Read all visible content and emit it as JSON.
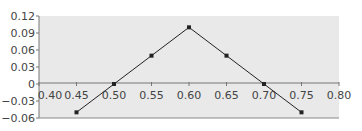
{
  "chart_data": {
    "type": "line",
    "title": "",
    "xlabel": "",
    "ylabel": "",
    "x": [
      0.45,
      0.5,
      0.55,
      0.6,
      0.65,
      0.7,
      0.75
    ],
    "series": [
      {
        "name": "series-1",
        "values": [
          -0.05,
          0.0,
          0.05,
          0.1,
          0.05,
          0.0,
          -0.05
        ],
        "color": "#222222"
      }
    ],
    "xlim": [
      0.4,
      0.8
    ],
    "ylim": [
      -0.06,
      0.12
    ],
    "x_ticks": [
      "0.40",
      "0.45",
      "0.50",
      "0.55",
      "0.60",
      "0.65",
      "0.70",
      "0.75",
      "0.80"
    ],
    "y_ticks": [
      "0.12",
      "0.09",
      "0.06",
      "0.03",
      "0",
      "−0.03",
      "−0.06"
    ],
    "grid": false,
    "legend": null,
    "plot_background": "#e9e9e9",
    "axis_color": "#777777"
  }
}
